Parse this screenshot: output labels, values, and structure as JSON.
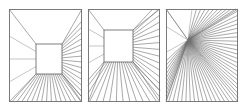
{
  "figure": {
    "title": "",
    "background_color": "#ffffff",
    "width": 248,
    "height": 111,
    "line_color": "#6e6e6e",
    "frame_color": "#7a7a7a",
    "panel_count": 3
  },
  "panels": [
    {
      "id": "panel-1",
      "label": "",
      "frame": {
        "x": 9,
        "y": 9,
        "width": 73,
        "height": 93
      },
      "inner_box": {
        "x": 36,
        "y": 44,
        "width": 26,
        "height": 30
      },
      "vanishing_point": {
        "x": 49,
        "y": 59
      },
      "has_inner_box": true,
      "ray_count": 34,
      "description": "one-point perspective room with centered rear wall"
    },
    {
      "id": "panel-2",
      "label": "",
      "frame": {
        "x": 88,
        "y": 9,
        "width": 72,
        "height": 93
      },
      "inner_box": {
        "x": 104,
        "y": 30,
        "width": 29,
        "height": 32
      },
      "vanishing_point": {
        "x": 118,
        "y": 46
      },
      "has_inner_box": true,
      "ray_count": 34,
      "description": "one-point perspective room with rear wall offset up and left"
    },
    {
      "id": "panel-3",
      "label": "",
      "frame": {
        "x": 166,
        "y": 9,
        "width": 72,
        "height": 93
      },
      "inner_box": null,
      "vanishing_point": {
        "x": 188,
        "y": 40
      },
      "has_inner_box": false,
      "ray_count": 38,
      "description": "radial convergence to a single vanishing point, no rear wall"
    }
  ],
  "chart_data": {
    "type": "diagram",
    "title": "",
    "subtitle": "",
    "xlabel": "",
    "ylabel": "",
    "legend": [],
    "annotations": [],
    "series": [
      {
        "name": "panel-1-rays",
        "vanishing_point": [
          49,
          59
        ],
        "box": [
          36,
          44,
          62,
          74
        ],
        "frame": [
          9,
          9,
          82,
          102
        ]
      },
      {
        "name": "panel-2-rays",
        "vanishing_point": [
          118,
          46
        ],
        "box": [
          104,
          30,
          133,
          62
        ],
        "frame": [
          88,
          9,
          160,
          102
        ]
      },
      {
        "name": "panel-3-rays",
        "vanishing_point": [
          188,
          40
        ],
        "box": null,
        "frame": [
          166,
          9,
          238,
          102
        ]
      }
    ]
  }
}
